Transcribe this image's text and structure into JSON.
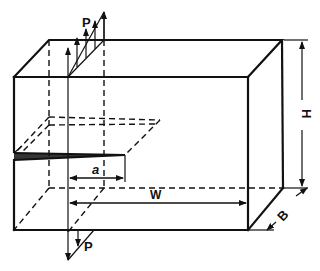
{
  "diagram": {
    "labels": {
      "load_top": "P",
      "load_bottom": "P",
      "crack_length": "a",
      "width": "W",
      "height": "H",
      "thickness": "B"
    },
    "colors": {
      "stroke": "#111111",
      "background": "#ffffff"
    }
  }
}
